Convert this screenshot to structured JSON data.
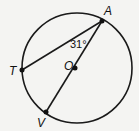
{
  "diagram": {
    "type": "circle-geometry",
    "circle": {
      "center_label": "O"
    },
    "points": [
      {
        "id": "A",
        "label": "A"
      },
      {
        "id": "T",
        "label": "T"
      },
      {
        "id": "V",
        "label": "V"
      },
      {
        "id": "O",
        "label": "O"
      }
    ],
    "segments": [
      "AT",
      "AV"
    ],
    "diameter": "AV",
    "angle": {
      "vertex": "A",
      "between": [
        "T",
        "V"
      ],
      "label": "31°"
    },
    "colors": {
      "stroke": "#1a1a1a",
      "background": "#f4f4f2"
    }
  }
}
